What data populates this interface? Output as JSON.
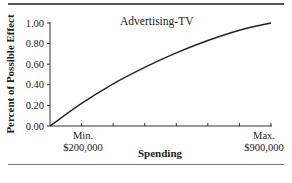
{
  "chart_data": {
    "type": "line",
    "title": "Advertising-TV",
    "xlabel": "Spending",
    "ylabel": "Percent of Possible Effect",
    "y_ticks": [
      "0.00",
      "0.20",
      "0.40",
      "0.60",
      "0.80",
      "1.00"
    ],
    "ylim": [
      0,
      1.0
    ],
    "x_tick_count": 7,
    "x_annotations": [
      {
        "position": 1,
        "line1": "Min.",
        "line2": "$200,000"
      },
      {
        "position": 7,
        "line1": "Max.",
        "line2": "$900,000"
      }
    ],
    "x": [
      0,
      1,
      2,
      3,
      4,
      5,
      6,
      7
    ],
    "values": [
      0.0,
      0.22,
      0.41,
      0.57,
      0.71,
      0.83,
      0.93,
      1.0
    ],
    "grid": false,
    "legend": "none"
  }
}
